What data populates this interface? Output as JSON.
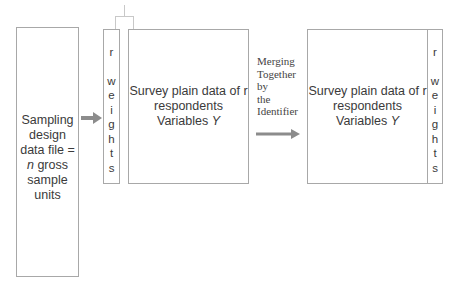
{
  "left_box": {
    "lines": [
      "Sampling",
      "design",
      "data file =",
      "n",
      "gross",
      "sample",
      "units"
    ]
  },
  "weights_left": {
    "letters": [
      "r",
      "",
      "w",
      "e",
      "i",
      "g",
      "h",
      "t",
      "s"
    ]
  },
  "survey_left": {
    "line1": "Survey plain data of r",
    "line2": "respondents",
    "line3_prefix": "Variables ",
    "line3_var": "Y"
  },
  "merge_label": {
    "lines": [
      "Merging",
      "Together",
      "by",
      "the",
      "Identifier"
    ]
  },
  "survey_right": {
    "line1": "Survey plain data of r",
    "line2": "respondents",
    "line3_prefix": "Variables ",
    "line3_var": "Y"
  },
  "weights_right": {
    "letters": [
      "r",
      "",
      "w",
      "e",
      "i",
      "g",
      "h",
      "t",
      "s"
    ]
  },
  "colors": {
    "border": "#a8a8a8",
    "arrow": "#8c8c8c",
    "text": "#3a3a3a"
  }
}
